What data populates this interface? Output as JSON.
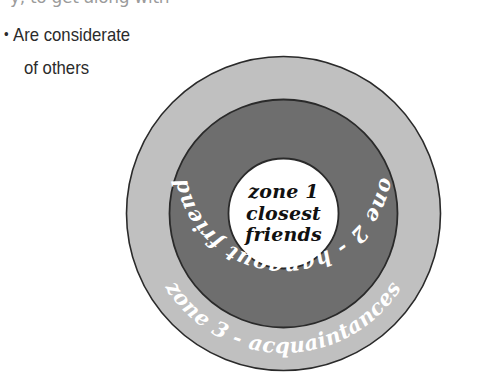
{
  "text_block": {
    "clipped_top_line": "y, to get along with",
    "bullet_symbol": "•",
    "bullet_line": "Are considerate",
    "bullet_continuation": "of others"
  },
  "diagram": {
    "type": "concentric-zones",
    "zones": [
      {
        "id": "zone1",
        "lines": [
          "zone 1",
          "closest",
          "friends"
        ],
        "label": "zone 1 closest friends",
        "fill": "#ffffff",
        "text_color": "#111111"
      },
      {
        "id": "zone2",
        "label": "zone 2 - hangout friends",
        "fill": "#6e6e6e",
        "text_color": "#ffffff"
      },
      {
        "id": "zone3",
        "label": "zone 3 - acquaintances",
        "fill": "#c0c0c0",
        "text_color": "#ffffff"
      }
    ],
    "outline_color": "#2a2a2a",
    "background": "#ffffff"
  }
}
